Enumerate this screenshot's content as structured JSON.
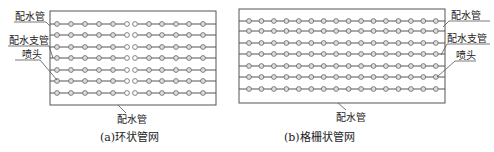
{
  "colors": {
    "background": "#ffffff",
    "line": "#555555",
    "head_stroke": "#666666",
    "text": "#222222"
  },
  "diagram_a": {
    "caption": "(a)环状管网",
    "labels": {
      "main_pipe_top": "配水管",
      "branch_pipe": "配水支管",
      "sprinkler_head": "喷头",
      "main_pipe_bottom": "配水管"
    },
    "box": {
      "x": 50,
      "y": 11,
      "w": 166,
      "h": 94
    },
    "rows_y": [
      24,
      35,
      47,
      58,
      70,
      81,
      93
    ],
    "left_group_x": [
      57,
      71,
      85,
      99,
      113,
      127
    ],
    "right_group_x": [
      135,
      149,
      162,
      176,
      189,
      203
    ],
    "open_heads": [
      "left_group_last",
      "right_group_first"
    ]
  },
  "diagram_b": {
    "caption": "(b)格栅状管网",
    "labels": {
      "main_pipe_top": "配水管",
      "branch_pipe": "配水支管",
      "sprinkler_head": "喷头",
      "main_pipe_bottom": "配水管"
    },
    "box": {
      "x": 239,
      "y": 9,
      "w": 206,
      "h": 94
    },
    "rows_y": [
      21,
      31,
      43,
      54,
      66,
      77,
      89
    ],
    "heads_per_row": 16,
    "head_start_x": 249,
    "head_spacing": 12.45
  }
}
